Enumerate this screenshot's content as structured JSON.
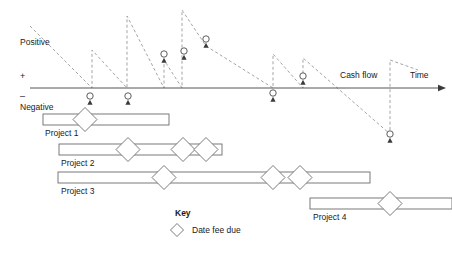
{
  "chart_data": {
    "type": "line",
    "title": "",
    "xlabel": "Time",
    "ylabel": "Cash flow",
    "grid": false,
    "legend_position": "bottom-center",
    "axis": {
      "y_pixel": 88,
      "x_start": 30,
      "x_end": 438,
      "axis_label_cashflow": "Cash flow",
      "axis_label_time": "Time",
      "label_positive": "Positive",
      "label_negative": "Negative",
      "sign_plus": "+",
      "sign_minus": "–"
    },
    "series": [
      {
        "name": "Cash flow events",
        "points": [
          {
            "x": 90,
            "y": -1,
            "sign": "negative",
            "pixel_x": 90,
            "pixel_y": 96
          },
          {
            "x": 128,
            "y": -1,
            "sign": "negative",
            "pixel_x": 128,
            "pixel_y": 96
          },
          {
            "x": 164,
            "y": 2,
            "sign": "positive",
            "pixel_x": 164,
            "pixel_y": 54
          },
          {
            "x": 184,
            "y": 2,
            "sign": "positive",
            "pixel_x": 184,
            "pixel_y": 51
          },
          {
            "x": 206,
            "y": 3,
            "sign": "positive",
            "pixel_x": 206,
            "pixel_y": 39
          },
          {
            "x": 273,
            "y": -1,
            "sign": "negative",
            "pixel_x": 273,
            "pixel_y": 93
          },
          {
            "x": 303,
            "y": 1,
            "sign": "positive",
            "pixel_x": 303,
            "pixel_y": 76
          },
          {
            "x": 390,
            "y": -4,
            "sign": "negative",
            "pixel_x": 390,
            "pixel_y": 134
          }
        ]
      },
      {
        "name": "Cumulative cash flow (sawtooth)",
        "style": "dashed",
        "vertices": [
          {
            "x": 30,
            "y": 26
          },
          {
            "x": 92,
            "y": 88
          },
          {
            "x": 92,
            "y": 50
          },
          {
            "x": 127,
            "y": 88
          },
          {
            "x": 127,
            "y": 16
          },
          {
            "x": 164,
            "y": 88
          },
          {
            "x": 164,
            "y": 60
          },
          {
            "x": 182,
            "y": 88
          },
          {
            "x": 182,
            "y": 10
          },
          {
            "x": 206,
            "y": 46
          },
          {
            "x": 273,
            "y": 88
          },
          {
            "x": 273,
            "y": 54
          },
          {
            "x": 303,
            "y": 88
          },
          {
            "x": 303,
            "y": 58
          },
          {
            "x": 390,
            "y": 134
          },
          {
            "x": 390,
            "y": 60
          },
          {
            "x": 418,
            "y": 70
          }
        ]
      }
    ],
    "projects": [
      {
        "label": "Project  1",
        "bar": {
          "x": 43,
          "y": 114,
          "width": 126,
          "height": 11
        },
        "label_pos": {
          "x": 45,
          "y": 136
        },
        "fee_due_markers": [
          {
            "x": 85,
            "y": 119.5
          }
        ]
      },
      {
        "label": "Project  2",
        "bar": {
          "x": 59,
          "y": 144,
          "width": 163,
          "height": 11
        },
        "label_pos": {
          "x": 61,
          "y": 166
        },
        "fee_due_markers": [
          {
            "x": 128,
            "y": 149.5
          },
          {
            "x": 183,
            "y": 149.5
          },
          {
            "x": 206,
            "y": 149.5
          }
        ]
      },
      {
        "label": "Project  3",
        "bar": {
          "x": 58,
          "y": 172,
          "width": 312,
          "height": 11
        },
        "label_pos": {
          "x": 61,
          "y": 194
        },
        "fee_due_markers": [
          {
            "x": 164,
            "y": 177.5
          },
          {
            "x": 273,
            "y": 177.5
          },
          {
            "x": 300,
            "y": 177.5
          }
        ]
      },
      {
        "label": "Project  4",
        "bar": {
          "x": 310,
          "y": 198,
          "width": 142,
          "height": 11
        },
        "label_pos": {
          "x": 313,
          "y": 220
        },
        "fee_due_markers": [
          {
            "x": 390,
            "y": 203.5
          }
        ]
      }
    ],
    "key": {
      "title": "Key",
      "title_pos": {
        "x": 175,
        "y": 216
      },
      "entries": [
        {
          "marker": "diamond-icon",
          "label": "Date fee due",
          "marker_pos": {
            "x": 177,
            "y": 230
          },
          "label_pos": {
            "x": 192,
            "y": 233
          }
        }
      ]
    },
    "colors": {
      "axis": "#555555",
      "outline": "#6b6b6b",
      "dashed": "#9a9a9a",
      "stem": "#6f6f6f",
      "text": "#1a1a1a",
      "background": "#ffffff"
    }
  }
}
